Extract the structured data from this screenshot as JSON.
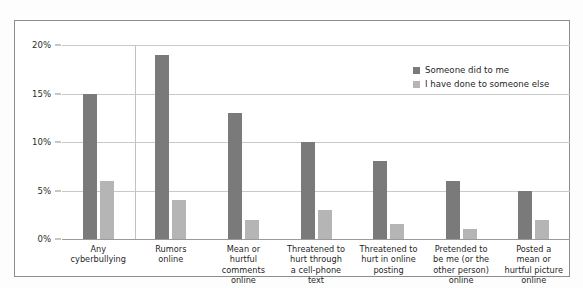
{
  "figure": {
    "frame_border_color": "#8d8d8d",
    "background_color": "#ffffff"
  },
  "legend": {
    "position": "top-right",
    "entries": [
      {
        "label": "Someone did to me",
        "color": "#7a7a7a"
      },
      {
        "label": "I have done to someone else",
        "color": "#b5b5b5"
      }
    ]
  },
  "yaxis": {
    "ticks": [
      {
        "label": "0%",
        "value": 0
      },
      {
        "label": "5%",
        "value": 5
      },
      {
        "label": "10%",
        "value": 10
      },
      {
        "label": "15%",
        "value": 15
      },
      {
        "label": "20%",
        "value": 20
      }
    ]
  },
  "chart_data": {
    "type": "bar",
    "title": "",
    "xlabel": "",
    "ylabel": "",
    "ylim": [
      0,
      20
    ],
    "ytick_labels": [
      "0%",
      "5%",
      "10%",
      "15%",
      "20%"
    ],
    "grid": true,
    "legend_position": "top-right",
    "categories": [
      "Any\ncyberbullying",
      "Rumors\nonline",
      "Mean or\nhurtful\ncomments\nonline",
      "Threatened to\nhurt through\na cell-phone\ntext",
      "Threatened to\nhurt in online\nposting",
      "Pretended to\nbe me (or the\nother person)\nonline",
      "Posted a\nmean or\nhurtful picture\nonline"
    ],
    "series": [
      {
        "name": "Someone did to me",
        "color": "#7a7a7a",
        "values": [
          15,
          19,
          13,
          10,
          8,
          6,
          5
        ]
      },
      {
        "name": "I have done to someone else",
        "color": "#b5b5b5",
        "values": [
          6,
          4,
          2,
          3,
          1.5,
          1,
          2
        ]
      }
    ]
  }
}
